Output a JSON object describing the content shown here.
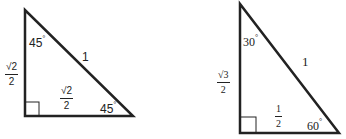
{
  "diagram": {
    "triangles": [
      {
        "id": "45-45-90",
        "hypotenuse": "1",
        "vertical_leg": {
          "num": "√2",
          "den": "2"
        },
        "horizontal_leg": {
          "num": "√2",
          "den": "2"
        },
        "top_angle": "45",
        "bottom_right_angle": "45",
        "degree_symbol": "°"
      },
      {
        "id": "30-60-90",
        "hypotenuse": "1",
        "vertical_leg": {
          "num": "√3",
          "den": "2"
        },
        "horizontal_leg": {
          "num": "1",
          "den": "2"
        },
        "top_angle": "30",
        "bottom_right_angle": "60",
        "degree_symbol": "°"
      }
    ],
    "stroke_color": "#222222"
  }
}
